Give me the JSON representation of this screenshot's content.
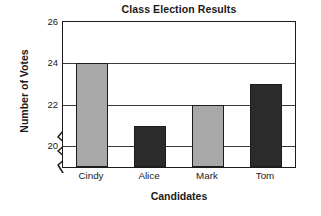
{
  "chart_data": {
    "type": "bar",
    "title": "Class Election Results",
    "xlabel": "Candidates",
    "ylabel": "Number of Votes",
    "categories": [
      "Cindy",
      "Alice",
      "Mark",
      "Tom"
    ],
    "values": [
      24,
      21,
      22,
      23
    ],
    "bar_colors": [
      "#a8a8a8",
      "#2b2b2b",
      "#a8a8a8",
      "#2b2b2b"
    ],
    "ylim": [
      19,
      26
    ],
    "yticks": [
      20,
      22,
      24,
      26
    ],
    "ytick_labels": [
      "20",
      "22",
      "24",
      "26"
    ],
    "grid": true,
    "legend": "none",
    "axis_break": true,
    "axis_break_note": "zigzag break on y-axis below 20",
    "frame_color": "#1c1c1c",
    "gridline_color": "#3a3a3a",
    "background": "#ffffff"
  }
}
